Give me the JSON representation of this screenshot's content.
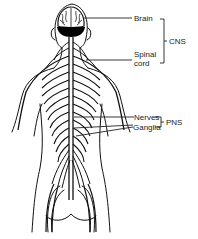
{
  "diagram": {
    "labels": {
      "brain": "Brain",
      "spinal_line1": "Spinal",
      "spinal_line2": "cord",
      "cns": "CNS",
      "nerves": "Nerves",
      "ganglia": "Ganglia",
      "pns": "PNS"
    },
    "colors": {
      "ink": "#111111",
      "background": "#ffffff"
    }
  }
}
